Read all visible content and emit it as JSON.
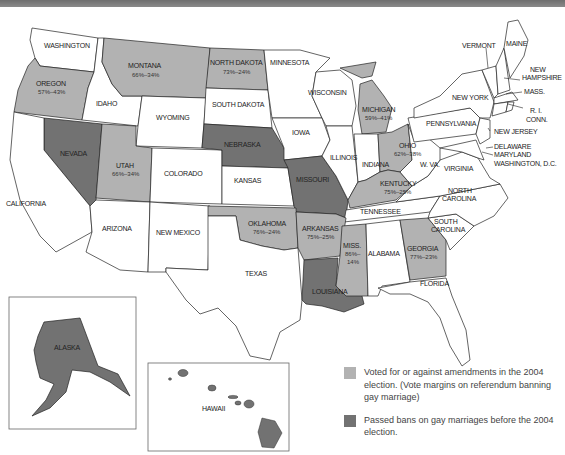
{
  "colors": {
    "voted_2004": "#b2b2b2",
    "passed_before": "#727272",
    "other": "#ffffff",
    "border": "#222222",
    "top_bar": "#7a7a7a"
  },
  "states": {
    "washington": {
      "name": "WASHINGTON"
    },
    "oregon": {
      "name": "OREGON",
      "margin": "57%–43%"
    },
    "idaho": {
      "name": "IDAHO"
    },
    "montana": {
      "name": "MONTANA",
      "margin": "66%–34%"
    },
    "wyoming": {
      "name": "WYOMING"
    },
    "north_dakota": {
      "name": "NORTH DAKOTA",
      "margin": "73%–24%"
    },
    "south_dakota": {
      "name": "SOUTH DAKOTA"
    },
    "minnesota": {
      "name": "MINNESOTA"
    },
    "wisconsin": {
      "name": "WISCONSIN"
    },
    "michigan": {
      "name": "MICHIGAN",
      "margin": "59%–41%"
    },
    "nevada": {
      "name": "NEVADA"
    },
    "utah": {
      "name": "UTAH",
      "margin": "66%–34%"
    },
    "colorado": {
      "name": "COLORADO"
    },
    "nebraska": {
      "name": "NEBRASKA"
    },
    "iowa": {
      "name": "IOWA"
    },
    "illinois": {
      "name": "ILLINOIS"
    },
    "indiana": {
      "name": "INDIANA"
    },
    "ohio": {
      "name": "OHIO",
      "margin": "62%–38%"
    },
    "kansas": {
      "name": "KANSAS"
    },
    "missouri": {
      "name": "MISSOURI"
    },
    "kentucky": {
      "name": "KENTUCKY",
      "margin": "75%–25%"
    },
    "california": {
      "name": "CALIFORNIA"
    },
    "arizona": {
      "name": "ARIZONA"
    },
    "new_mexico": {
      "name": "NEW MEXICO"
    },
    "oklahoma": {
      "name": "OKLAHOMA",
      "margin": "76%–24%"
    },
    "arkansas": {
      "name": "ARKANSAS",
      "margin": "75%–25%"
    },
    "tennessee": {
      "name": "TENNESSEE"
    },
    "texas": {
      "name": "TEXAS"
    },
    "louisiana": {
      "name": "LOUISIANA"
    },
    "mississippi": {
      "name": "MISS.",
      "margin_line1": "86%–",
      "margin_line2": "14%"
    },
    "alabama": {
      "name": "ALABAMA"
    },
    "georgia": {
      "name": "GEORGIA",
      "margin": "77%–23%"
    },
    "florida": {
      "name": "FLORIDA"
    },
    "south_carolina": {
      "name_line1": "SOUTH",
      "name_line2": "CAROLINA"
    },
    "north_carolina": {
      "name_line1": "NORTH",
      "name_line2": "CAROLINA"
    },
    "virginia": {
      "name": "VIRGINIA"
    },
    "west_virginia": {
      "name": "W. VA."
    },
    "pennsylvania": {
      "name": "PENNSYLVANIA"
    },
    "new_york": {
      "name": "NEW YORK"
    },
    "vermont": {
      "name": "VERMONT"
    },
    "maine": {
      "name": "MAINE"
    },
    "new_hampshire": {
      "name_line1": "NEW",
      "name_line2": "HAMPSHIRE"
    },
    "massachusetts": {
      "name": "MASS."
    },
    "rhode_island": {
      "name": "R. I."
    },
    "connecticut": {
      "name": "CONN."
    },
    "new_jersey": {
      "name": "NEW JERSEY"
    },
    "delaware": {
      "name": "DELAWARE"
    },
    "maryland": {
      "name": "MARYLAND"
    },
    "dc": {
      "name": "WASHINGTON, D.C."
    },
    "alaska": {
      "name": "ALASKA"
    },
    "hawaii": {
      "name": "HAWAII"
    }
  },
  "legend": {
    "items": [
      {
        "label": "Voted for or against amendments in the 2004 election. (Vote margins on referendum banning gay marriage)"
      },
      {
        "label": "Passed bans on gay marriages before the 2004 election."
      }
    ]
  }
}
